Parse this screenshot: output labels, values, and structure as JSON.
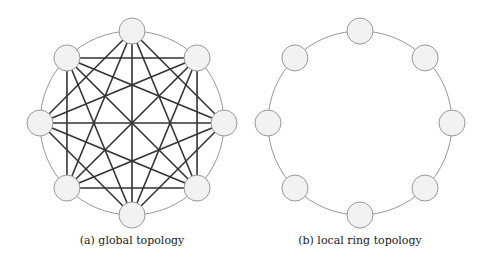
{
  "figures": [
    {
      "id": "a",
      "caption": "(a) global topology",
      "type": "fully-connected",
      "center": [
        132,
        123
      ],
      "ring_radius": 92,
      "node_count": 8
    },
    {
      "id": "b",
      "caption": "(b) local ring topology",
      "type": "ring",
      "center": [
        360,
        123
      ],
      "ring_radius": 92,
      "node_count": 8
    }
  ],
  "style": {
    "node_fill": "#f2f2f2",
    "node_stroke": "#999999",
    "ring_stroke": "#999999",
    "edge_stroke": "#333333",
    "node_radius": 13
  }
}
